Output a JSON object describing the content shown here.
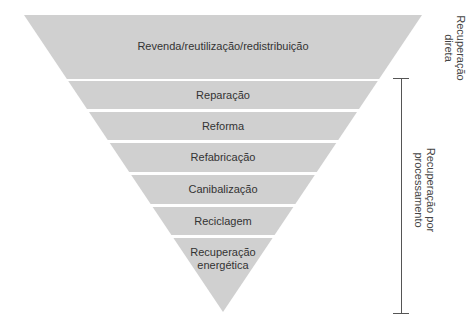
{
  "diagram": {
    "type": "inverted-pyramid",
    "fill_color": "#d0d0d0",
    "text_color": "#333333",
    "bracket_color": "#555555",
    "apex": {
      "x": 223,
      "y": 312
    },
    "top": {
      "left_x": 24,
      "right_x": 422,
      "y": 15
    },
    "levels": [
      {
        "label": "Revenda/reutilização/redistribuição",
        "y_top": 15,
        "y_bottom": 79
      },
      {
        "label": "Reparação",
        "y_top": 81,
        "y_bottom": 109
      },
      {
        "label": "Reforma",
        "y_top": 112,
        "y_bottom": 140
      },
      {
        "label": "Refabricação",
        "y_top": 143,
        "y_bottom": 172
      },
      {
        "label": "Canibalização",
        "y_top": 175,
        "y_bottom": 204
      },
      {
        "label": "Reciclagem",
        "y_top": 207,
        "y_bottom": 235
      },
      {
        "label": "Recuperação energética",
        "y_top": 238,
        "y_bottom": 312
      }
    ],
    "side_labels": {
      "direct": {
        "line1": "Recuperação",
        "line2": "direta"
      },
      "processing": {
        "line1": "Recuperação por",
        "line2": "processamento"
      }
    },
    "bracket": {
      "x": 401,
      "y_top": 78,
      "y_bottom": 313,
      "tick_half_width": 8
    }
  }
}
